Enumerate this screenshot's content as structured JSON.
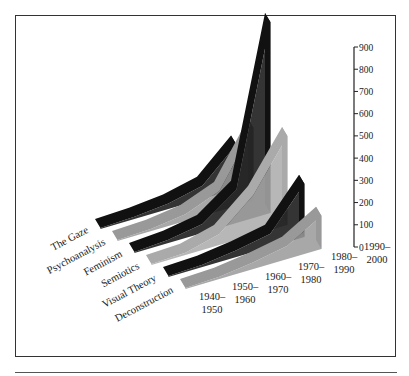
{
  "chart_data": {
    "type": "area",
    "style": "3d-ribbon",
    "title": "",
    "xlabel": "",
    "ylabel": "",
    "ylim": [
      0,
      900
    ],
    "yticks": [
      0,
      100,
      200,
      300,
      400,
      500,
      600,
      700,
      800,
      900
    ],
    "grid": false,
    "legend": "none (series labeled along depth axis)",
    "categories": [
      "1940–1950",
      "1950–1960",
      "1960–1970",
      "1970–1980",
      "1980–1990",
      "1990–2000"
    ],
    "category_labels": [
      [
        "1940–",
        "1950"
      ],
      [
        "1950–",
        "1960"
      ],
      [
        "1960–",
        "1970"
      ],
      [
        "1970–",
        "1980"
      ],
      [
        "1980–",
        "1990"
      ],
      [
        "1990–",
        "2000"
      ]
    ],
    "series": [
      {
        "name": "The Gaze",
        "color": "#111111",
        "values": [
          5,
          10,
          25,
          60,
          200,
          0
        ]
      },
      {
        "name": "Psychoanalysis",
        "color": "#999999",
        "values": [
          5,
          10,
          30,
          90,
          330,
          0
        ]
      },
      {
        "name": "Feminism",
        "color": "#111111",
        "values": [
          5,
          15,
          40,
          150,
          860,
          0
        ]
      },
      {
        "name": "Semiotics",
        "color": "#aaaaaa",
        "values": [
          5,
          10,
          50,
          180,
          400,
          0
        ]
      },
      {
        "name": "Visual Theory",
        "color": "#111111",
        "values": [
          5,
          10,
          30,
          60,
          240,
          0
        ]
      },
      {
        "name": "Deconstruction",
        "color": "#999999",
        "values": [
          5,
          10,
          30,
          60,
          150,
          0
        ]
      }
    ]
  },
  "axis": {
    "tick_labels": [
      "0",
      "100",
      "200",
      "300",
      "400",
      "500",
      "600",
      "700",
      "800",
      "900"
    ]
  }
}
